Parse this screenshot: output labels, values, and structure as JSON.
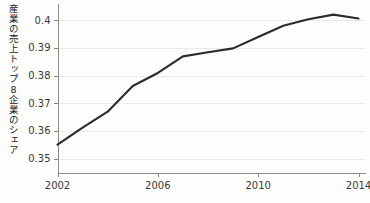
{
  "chart_data": {
    "type": "line",
    "title": "",
    "xlabel": "",
    "ylabel": "産業の売上トップ8企業のシェア",
    "xlim": [
      2002,
      2014
    ],
    "ylim": [
      0.345,
      0.4045
    ],
    "xticks": [
      2002,
      2006,
      2010,
      2014
    ],
    "xtick_labels": [
      "2002",
      "2006",
      "2010",
      "2014"
    ],
    "yticks": [
      0.35,
      0.36,
      0.37,
      0.38,
      0.39,
      0.4
    ],
    "ytick_labels": [
      "0.35",
      "0.36",
      "0.37",
      "0.38",
      "0.39",
      "0.4"
    ],
    "grid": "horizontal",
    "legend": "none",
    "line_color": "#2b2b2b",
    "grid_color": "#eceae8",
    "axis_color": "#8a8a88",
    "background_color": "#fdfdfc",
    "x": [
      2002,
      2003,
      2004,
      2005,
      2006,
      2007,
      2008,
      2009,
      2010,
      2011,
      2012,
      2013,
      2014
    ],
    "values": [
      0.3551,
      0.3612,
      0.367,
      0.3763,
      0.381,
      0.387,
      0.3885,
      0.3899,
      0.394,
      0.3981,
      0.4004,
      0.4021,
      0.4007
    ],
    "series": [
      {
        "name": "産業の売上トップ8企業のシェア",
        "values": [
          0.3551,
          0.3612,
          0.367,
          0.3763,
          0.381,
          0.387,
          0.3885,
          0.3899,
          0.394,
          0.3981,
          0.4004,
          0.4021,
          0.4007
        ]
      }
    ]
  }
}
